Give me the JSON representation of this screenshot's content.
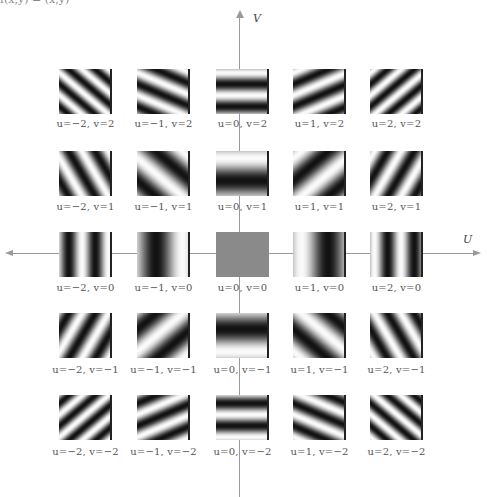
{
  "figure": {
    "top_fragment": "f(x,y) = (x,y)",
    "axes": {
      "horizontal_label": "U",
      "vertical_label": "V",
      "color": "#9a9a9a"
    },
    "center_tile_color": "#8a8a8a",
    "tiles": [
      {
        "u": -2,
        "v": 2,
        "label": "u=−2, v=2"
      },
      {
        "u": -1,
        "v": 2,
        "label": "u=−1, v=2"
      },
      {
        "u": 0,
        "v": 2,
        "label": "u=0, v=2"
      },
      {
        "u": 1,
        "v": 2,
        "label": "u=1, v=2"
      },
      {
        "u": 2,
        "v": 2,
        "label": "u=2, v=2"
      },
      {
        "u": -2,
        "v": 1,
        "label": "u=−2, v=1"
      },
      {
        "u": -1,
        "v": 1,
        "label": "u=−1, v=1"
      },
      {
        "u": 0,
        "v": 1,
        "label": "u=0, v=1"
      },
      {
        "u": 1,
        "v": 1,
        "label": "u=1, v=1"
      },
      {
        "u": 2,
        "v": 1,
        "label": "u=2, v=1"
      },
      {
        "u": -2,
        "v": 0,
        "label": "u=−2, v=0"
      },
      {
        "u": -1,
        "v": 0,
        "label": "u=−1, v=0"
      },
      {
        "u": 0,
        "v": 0,
        "label": "u=0, v=0"
      },
      {
        "u": 1,
        "v": 0,
        "label": "u=1, v=0"
      },
      {
        "u": 2,
        "v": 0,
        "label": "u=2, v=0"
      },
      {
        "u": -2,
        "v": -1,
        "label": "u=−2, v=−1"
      },
      {
        "u": -1,
        "v": -1,
        "label": "u=−1, v=−1"
      },
      {
        "u": 0,
        "v": -1,
        "label": "u=0, v=−1"
      },
      {
        "u": 1,
        "v": -1,
        "label": "u=1, v=−1"
      },
      {
        "u": 2,
        "v": -1,
        "label": "u=2, v=−1"
      },
      {
        "u": -2,
        "v": -2,
        "label": "u=−2, v=−2"
      },
      {
        "u": -1,
        "v": -2,
        "label": "u=−1, v=−2"
      },
      {
        "u": 0,
        "v": -2,
        "label": "u=0, v=−2"
      },
      {
        "u": 1,
        "v": -2,
        "label": "u=1, v=−2"
      },
      {
        "u": 2,
        "v": -2,
        "label": "u=2, v=−2"
      }
    ]
  }
}
